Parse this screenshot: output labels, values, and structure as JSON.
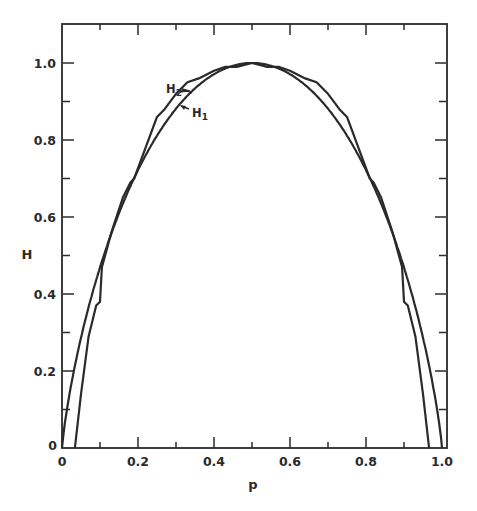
{
  "chart_data": {
    "type": "line",
    "title": "",
    "xlabel": "p",
    "ylabel": "H",
    "xlim": [
      0,
      1.0
    ],
    "ylim": [
      0,
      1.1
    ],
    "grid": false,
    "legend": "none (inline annotations)",
    "x_ticks": [
      "0",
      "0.2",
      "0.4",
      "0.6",
      "0.8",
      "1.0"
    ],
    "y_ticks": [
      "0",
      "0.2",
      "0.4",
      "0.6",
      "0.8",
      "1.0"
    ],
    "annotations": [
      {
        "text": "H2",
        "points_to": "outer scalloped curve",
        "at": [
          0.29,
          0.96
        ]
      },
      {
        "text": "H1",
        "points_to": "inner smooth curve",
        "at": [
          0.33,
          0.91
        ]
      }
    ],
    "series": [
      {
        "name": "H1",
        "description": "smooth binary entropy curve",
        "x": [
          0,
          0.01,
          0.02,
          0.05,
          0.1,
          0.15,
          0.2,
          0.25,
          0.3,
          0.35,
          0.4,
          0.45,
          0.5,
          0.55,
          0.6,
          0.65,
          0.7,
          0.75,
          0.8,
          0.85,
          0.9,
          0.95,
          0.98,
          0.99,
          1.0
        ],
        "y": [
          0,
          0.081,
          0.141,
          0.286,
          0.469,
          0.61,
          0.722,
          0.811,
          0.881,
          0.934,
          0.971,
          0.993,
          1.0,
          0.993,
          0.971,
          0.934,
          0.881,
          0.811,
          0.722,
          0.61,
          0.469,
          0.286,
          0.141,
          0.081,
          0
        ]
      },
      {
        "name": "H2",
        "description": "scalloped approximation curve",
        "x": [
          0.034,
          0.05,
          0.07,
          0.09,
          0.1,
          0.105,
          0.13,
          0.16,
          0.18,
          0.19,
          0.22,
          0.25,
          0.27,
          0.3,
          0.33,
          0.36,
          0.4,
          0.43,
          0.46,
          0.5,
          0.54,
          0.57,
          0.6,
          0.64,
          0.67,
          0.7,
          0.73,
          0.75,
          0.78,
          0.81,
          0.82,
          0.84,
          0.87,
          0.895,
          0.9,
          0.91,
          0.93,
          0.95,
          0.966
        ],
        "y": [
          0,
          0.14,
          0.29,
          0.37,
          0.38,
          0.47,
          0.56,
          0.65,
          0.69,
          0.7,
          0.78,
          0.86,
          0.88,
          0.92,
          0.95,
          0.96,
          0.98,
          0.99,
          0.99,
          1.0,
          0.99,
          0.99,
          0.98,
          0.96,
          0.95,
          0.92,
          0.88,
          0.86,
          0.78,
          0.7,
          0.69,
          0.65,
          0.56,
          0.47,
          0.38,
          0.37,
          0.29,
          0.14,
          0
        ]
      }
    ]
  }
}
